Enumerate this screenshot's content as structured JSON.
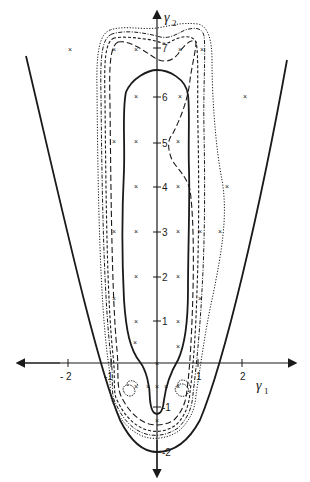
{
  "figure": {
    "type": "contour-diagram",
    "x_axis": {
      "label": "γ",
      "subscript": "1",
      "ticks": [
        {
          "value": -2,
          "label": "- 2"
        },
        {
          "value": -1,
          "label": "-1"
        },
        {
          "value": 1,
          "label": "1"
        },
        {
          "value": 2,
          "label": "2"
        }
      ]
    },
    "y_axis": {
      "label": "γ",
      "subscript": "2",
      "ticks": [
        {
          "value": 7,
          "label": "7"
        },
        {
          "value": 6,
          "label": "6"
        },
        {
          "value": 5,
          "label": "5"
        },
        {
          "value": 4,
          "label": "4"
        },
        {
          "value": 3,
          "label": "3"
        },
        {
          "value": 2,
          "label": "2"
        },
        {
          "value": 1,
          "label": "1"
        },
        {
          "value": -1,
          "label": "-1"
        },
        {
          "value": -2,
          "label": "-2"
        }
      ]
    },
    "curves": [
      {
        "name": "outer-parabola",
        "style": "solid-thick"
      },
      {
        "name": "inner-solid-region",
        "style": "solid-thick"
      },
      {
        "name": "dashed-long-region",
        "style": "long-dash"
      },
      {
        "name": "dashed-short-region",
        "style": "short-dash"
      },
      {
        "name": "dash-dot-region",
        "style": "dash-dot"
      },
      {
        "name": "dotted-region",
        "style": "dotted"
      }
    ],
    "sample_points_marker": "×",
    "colors": {
      "ink": "#1a1a1a",
      "background": "#ffffff"
    }
  }
}
